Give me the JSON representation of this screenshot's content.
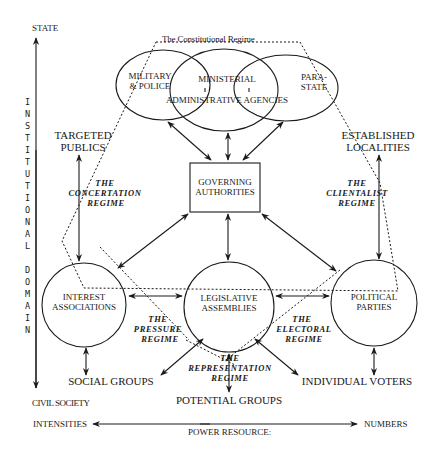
{
  "title": "The Constitutional Regime",
  "axes": {
    "vertical": {
      "top_label": "STATE",
      "bottom_label": "CIVIL SOCIETY",
      "axis_title": "INSTITUTIONAL DOMAIN"
    },
    "horizontal": {
      "left_label": "INTENSITIES",
      "right_label": "NUMBERS",
      "axis_title": "POWER RESOURCE:"
    }
  },
  "nodes": {
    "military": {
      "line1": "MILITARY",
      "line2": "& POLICE"
    },
    "ministerial": {
      "line1": "MINISTERIAL"
    },
    "administrative": {
      "line1": "ADMINISTRATIVE AGENCIES"
    },
    "parastate": {
      "line1": "PARA-",
      "line2": "STATE"
    },
    "governing": {
      "line1": "GOVERNING",
      "line2": "AUTHORITIES"
    },
    "interest": {
      "line1": "INTEREST",
      "line2": "ASSOCIATIONS"
    },
    "legislative": {
      "line1": "LEGISLATIVE",
      "line2": "ASSEMBLIES"
    },
    "parties": {
      "line1": "POLITICAL",
      "line2": "PARTIES"
    },
    "targeted": {
      "line1": "TARGETED",
      "line2": "PUBLICS"
    },
    "localities": {
      "line1": "ESTABLISHED",
      "line2": "LOCALITIES"
    },
    "social": {
      "line1": "SOCIAL GROUPS"
    },
    "potential": {
      "line1": "POTENTIAL GROUPS"
    },
    "voters": {
      "line1": "INDIVIDUAL VOTERS"
    }
  },
  "regimes": {
    "concertation": {
      "line1": "THE",
      "line2": "CONCERTATION",
      "line3": "REGIME"
    },
    "clientalist": {
      "line1": "THE",
      "line2": "CLIENTALIST",
      "line3": "REGIME"
    },
    "pressure": {
      "line1": "THE",
      "line2": "PRESSURE",
      "line3": "REGIME"
    },
    "electoral": {
      "line1": "THE",
      "line2": "ELECTORAL",
      "line3": "REGIME"
    },
    "representation": {
      "line1": "THE",
      "line2": "REPRESENTATION",
      "line3": "REGIME"
    }
  },
  "vertical_letters": [
    "I",
    "N",
    "S",
    "T",
    "I",
    "T",
    "U",
    "T",
    "I",
    "O",
    "N",
    "A",
    "L",
    "",
    "D",
    "O",
    "M",
    "A",
    "I",
    "N"
  ]
}
